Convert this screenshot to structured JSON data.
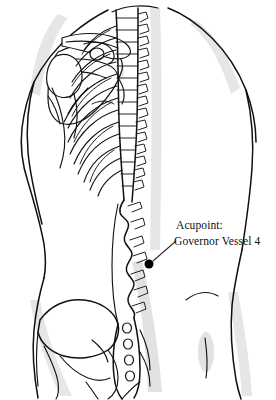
{
  "figure": {
    "kind": "anatomical-illustration",
    "width": 276,
    "height": 400,
    "background_color": "#ffffff",
    "line_color": "#101010",
    "shade_color": "#c9c9c9"
  },
  "annotation": {
    "label_line1": "Acupoint:",
    "label_line2": "Governor Vessel 4",
    "marker": {
      "shape": "filled-circle",
      "color": "#000000",
      "radius": 4.5,
      "x": 149,
      "y": 264
    },
    "leader_line": {
      "from_x": 153,
      "from_y": 261,
      "to_x": 176,
      "to_y": 241,
      "color": "#303030"
    }
  },
  "structures": [
    {
      "name": "body-outline",
      "label": "Torso outline"
    },
    {
      "name": "left-scapula",
      "label": "Scapula"
    },
    {
      "name": "left-clavicle",
      "label": "Clavicle"
    },
    {
      "name": "left-humerus-head",
      "label": "Humeral head"
    },
    {
      "name": "thoracic-vertebrae",
      "label": "Thoracic vertebrae"
    },
    {
      "name": "ribcage",
      "label": "Ribs"
    },
    {
      "name": "lumbar-vertebrae",
      "label": "Lumbar vertebrae"
    },
    {
      "name": "sacrum",
      "label": "Sacrum"
    },
    {
      "name": "sacral-foramina",
      "label": "Sacral foramina"
    },
    {
      "name": "ilium",
      "label": "Ilium / iliac crest"
    }
  ]
}
